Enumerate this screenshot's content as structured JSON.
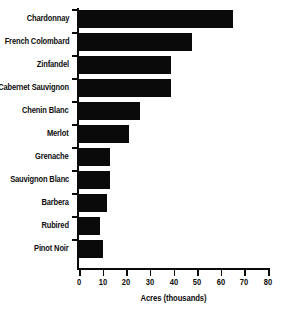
{
  "chart_data": {
    "type": "bar",
    "orientation": "horizontal",
    "title": "",
    "xlabel": "Acres (thousands)",
    "ylabel": "",
    "xlim": [
      0,
      80
    ],
    "xticks": [
      0,
      10,
      20,
      30,
      40,
      50,
      60,
      70,
      80
    ],
    "grid": false,
    "legend": null,
    "bar_color": "#0a0a0a",
    "categories": [
      "Chardonnay",
      "French Colombard",
      "Zinfandel",
      "Cabernet Sauvignon",
      "Chenin Blanc",
      "Merlot",
      "Grenache",
      "Sauvignon Blanc",
      "Barbera",
      "Rubired",
      "Pinot Noir"
    ],
    "values": [
      65,
      48,
      39,
      39,
      26,
      21,
      13,
      13,
      12,
      9,
      10
    ]
  }
}
